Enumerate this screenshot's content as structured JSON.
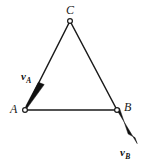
{
  "figure": {
    "type": "geometric-diagram",
    "background_color": "#ffffff",
    "stroke_color": "#1a1a1a",
    "width": 147,
    "height": 167,
    "vertices": [
      {
        "id": "C",
        "label": "C",
        "x": 70,
        "y": 21,
        "marker": "open-circle"
      },
      {
        "id": "A",
        "label": "A",
        "x": 25,
        "y": 110,
        "marker": "open-circle"
      },
      {
        "id": "B",
        "label": "B",
        "x": 117,
        "y": 110,
        "marker": "open-circle"
      }
    ],
    "edges": [
      {
        "id": "CA",
        "from": "C",
        "to": "A"
      },
      {
        "id": "CB",
        "from": "C",
        "to": "B"
      },
      {
        "id": "AB",
        "from": "A",
        "to": "B"
      }
    ],
    "vectors": [
      {
        "id": "vA",
        "symbol": "v",
        "subscript": "A",
        "anchor": "A",
        "tail_x": 43,
        "tail_y": 87,
        "head_x": 25,
        "head_y": 110,
        "label_x": 21,
        "label_y": 71,
        "direction": "down-left along edge CA"
      },
      {
        "id": "vB",
        "symbol": "v",
        "subscript": "B",
        "anchor": "B",
        "tail_x": 117,
        "tail_y": 110,
        "head_x": 136,
        "head_y": 142,
        "label_x": 120,
        "label_y": 147,
        "direction": "down-right extending edge CB"
      }
    ],
    "labels": {
      "vertex_C": "C",
      "vertex_A": "A",
      "vertex_B": "B",
      "vector_A_symbol": "v",
      "vector_A_subscript": "A",
      "vector_B_symbol": "v",
      "vector_B_subscript": "B"
    }
  }
}
